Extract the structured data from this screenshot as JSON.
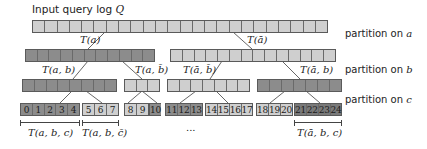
{
  "title": "Input query log Q",
  "title_parts": {
    "text": "Input query log ",
    "var": "Q"
  },
  "side_labels": [
    {
      "text": "partition on ",
      "var": "a"
    },
    {
      "text": "partition on ",
      "var": "b"
    },
    {
      "text": "partition on ",
      "var": "c"
    }
  ],
  "colors": {
    "light": "#cfcfcf",
    "dark": "#8c8c8c",
    "darker": "#7a7a7a",
    "border": "#5a5a5a",
    "line": "#555555"
  },
  "row1": {
    "cells": 24,
    "shade": "light"
  },
  "row2": [
    {
      "cells": 11,
      "shade": "dark"
    },
    {
      "cells": 14,
      "shade": "light"
    }
  ],
  "row3": [
    {
      "cells": 8,
      "shade": "dark"
    },
    {
      "cells": 3,
      "shade": "light"
    },
    {
      "cells": 7,
      "shade": "light"
    },
    {
      "cells": 7,
      "shade": "dark"
    }
  ],
  "row4": [
    {
      "shade": "dark",
      "labels": [
        "0",
        "1",
        "2",
        "3",
        "4"
      ]
    },
    {
      "shade": "light",
      "labels": [
        "5",
        "6",
        "7"
      ]
    },
    {
      "shade": "light",
      "labels": [
        "8",
        "9"
      ]
    },
    {
      "shade": "dark",
      "labels": [
        "10"
      ]
    },
    {
      "shade": "dark",
      "labels": [
        "11",
        "12",
        "13"
      ]
    },
    {
      "shade": "light",
      "labels": [
        "14",
        "15",
        "16",
        "17"
      ]
    },
    {
      "shade": "light",
      "labels": [
        "18",
        "19",
        "20"
      ]
    },
    {
      "shade": "darker",
      "labels": [
        "21",
        "22",
        "23",
        "24"
      ]
    }
  ],
  "branch_labels": {
    "t_a": "T(a)",
    "t_abar": "T(ā)",
    "t_a_b": "T(a, b)",
    "t_a_bbar": "T(a, b̄)",
    "t_abar_bbar": "T(ā, b̄)",
    "t_abar_b": "T(ā, b)"
  },
  "bracket_labels": {
    "t_a_b_c": "T(a, b, c)",
    "t_a_b_cbar": "T(a, b, c̄)",
    "t_abar_b_c": "T(ā, b, c)"
  },
  "ellipsis": "..."
}
